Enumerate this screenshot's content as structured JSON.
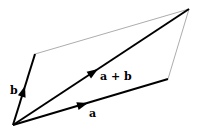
{
  "diagram": {
    "colors": {
      "vector": "#000000",
      "construction": "#888888",
      "background": "#ffffff"
    },
    "vectors": [
      {
        "id": "a",
        "label": "a",
        "from": [
          13,
          125
        ],
        "to": [
          168,
          79
        ]
      },
      {
        "id": "b",
        "label": "b",
        "from": [
          13,
          125
        ],
        "to": [
          35,
          54
        ]
      },
      {
        "id": "a_plus_b",
        "label": "a + b",
        "from": [
          13,
          125
        ],
        "to": [
          189,
          9
        ]
      }
    ],
    "construction_lines": [
      {
        "from": [
          35,
          54
        ],
        "to": [
          189,
          9
        ]
      },
      {
        "from": [
          168,
          79
        ],
        "to": [
          189,
          9
        ]
      }
    ],
    "labels": {
      "a": "a",
      "b": "b",
      "a_plus_b": "a + b"
    }
  }
}
